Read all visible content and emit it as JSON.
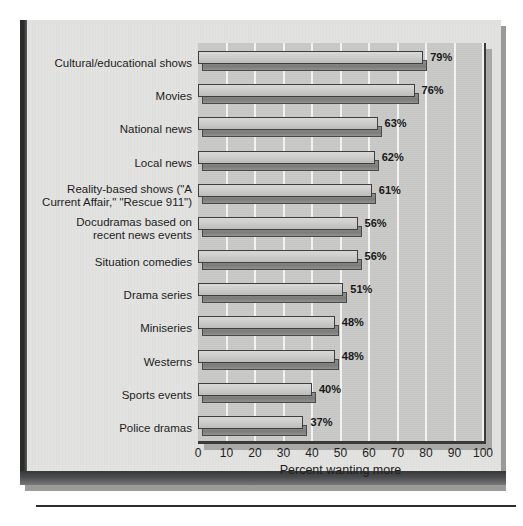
{
  "chart_data": {
    "type": "bar",
    "orientation": "horizontal",
    "title": "",
    "xlabel": "Percent wanting more",
    "ylabel": "",
    "xlim": [
      0,
      100
    ],
    "xticks": [
      0,
      10,
      20,
      30,
      40,
      50,
      60,
      70,
      80,
      90,
      100
    ],
    "xtick_labels": [
      "0",
      "10",
      "20",
      "30",
      "40",
      "50",
      "60",
      "70",
      "80",
      "90",
      "100"
    ],
    "grid": "vertical-white-gridlines",
    "legend": "none",
    "value_label_suffix": "%",
    "categories": [
      "Cultural/educational shows",
      "Movies",
      "National news",
      "Local news",
      "Reality-based shows (\"A\nCurrent Affair,\" \"Rescue 911\")",
      "Docudramas based on\nrecent news events",
      "Situation comedies",
      "Drama series",
      "Miniseries",
      "Westerns",
      "Sports events",
      "Police dramas"
    ],
    "values": [
      79,
      76,
      63,
      62,
      61,
      56,
      56,
      51,
      48,
      48,
      40,
      37
    ],
    "value_labels": [
      "79%",
      "76%",
      "63%",
      "62%",
      "61%",
      "56%",
      "56%",
      "51%",
      "48%",
      "48%",
      "40%",
      "37%"
    ]
  },
  "colors": {
    "paper": "#e3e3e1",
    "plot_background": "#c9c9c7",
    "bar_face": "#cfcfcd",
    "bar_shadow": "#7c7c7a",
    "gridline": "#f2f2f0",
    "axis_border": "#3a3a3a",
    "text": "#1d1d1d",
    "spine": "#2b2b2b"
  }
}
